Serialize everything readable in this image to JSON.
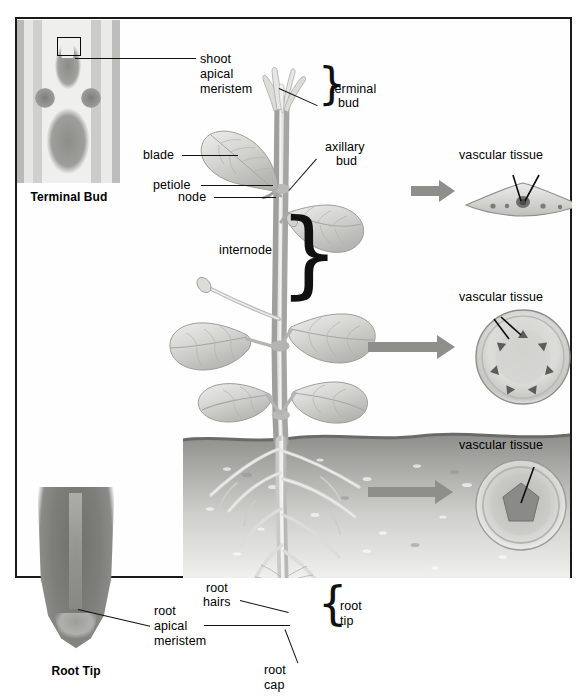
{
  "figure": {
    "insets": [
      {
        "caption": "Terminal Bud",
        "type": "micrograph"
      },
      {
        "caption": "Root Tip",
        "type": "micrograph"
      }
    ]
  },
  "labels": {
    "shoot_apical_meristem": "shoot\napical\nmeristem",
    "shoot_apical_meristem_line1": "shoot",
    "shoot_apical_meristem_line2": "apical",
    "shoot_apical_meristem_line3": "meristem",
    "terminal_bud_line1": "terminal",
    "terminal_bud_line2": "bud",
    "axillary_bud_line1": "axillary",
    "axillary_bud_line2": "bud",
    "blade": "blade",
    "petiole": "petiole",
    "node": "node",
    "internode": "internode",
    "root_hairs_line1": "root",
    "root_hairs_line2": "hairs",
    "root_apical_meristem_line1": "root",
    "root_apical_meristem_line2": "apical",
    "root_apical_meristem_line3": "meristem",
    "root_cap_line1": "root",
    "root_cap_line2": "cap",
    "root_tip_line1": "root",
    "root_tip_line2": "tip",
    "vascular_tissue_leaf": "vascular tissue",
    "vascular_tissue_stem": "vascular tissue",
    "vascular_tissue_root": "vascular tissue",
    "inset_terminal_bud": "Terminal Bud",
    "inset_root_tip": "Root Tip"
  },
  "cross_sections": [
    {
      "id": "leaf",
      "shape": "lens",
      "label": "vascular tissue",
      "bundles": 5,
      "pointers": 2
    },
    {
      "id": "stem",
      "shape": "circle",
      "label": "vascular tissue",
      "bundles": 7,
      "pointers": 2
    },
    {
      "id": "root",
      "shape": "circle",
      "label": "vascular tissue",
      "bundles": 1,
      "pointers": 1
    }
  ],
  "colors": {
    "frame": "#1a1a1a",
    "leader_line": "#111111",
    "text": "#000000",
    "background": "#ffffff",
    "soil_dark": "#9d9d9a",
    "soil_light": "#e9e9e7",
    "plant_gray": "#c9c9c6",
    "arrow_gray": "#8e8e8b",
    "micrograph_gray": "#7e7e7b"
  }
}
